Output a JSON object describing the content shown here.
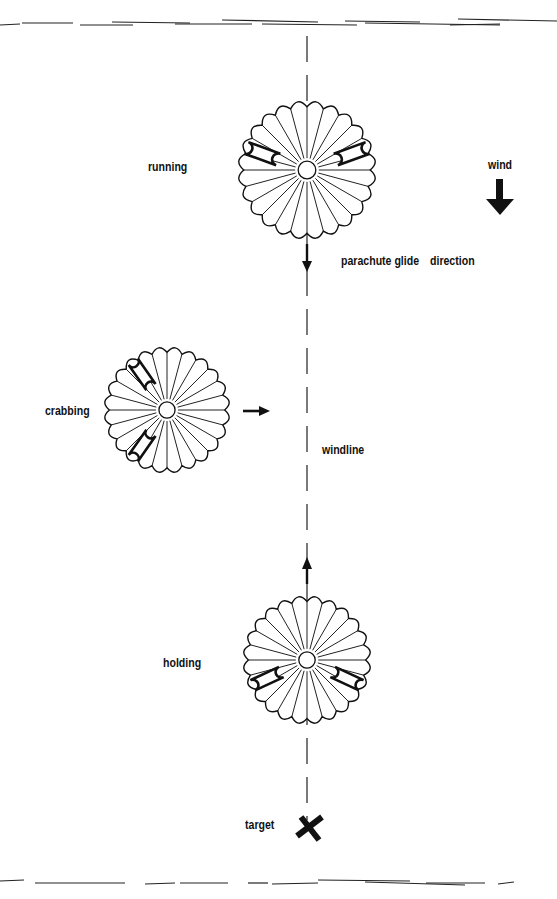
{
  "diagram": {
    "title": "",
    "labels": {
      "running": "running",
      "wind": "wind",
      "glide": "parachute glide",
      "direction": "direction",
      "crabbing": "crabbing",
      "windline": "windline",
      "holding": "holding",
      "target": "target"
    },
    "parachutes": [
      {
        "id": "running",
        "label": "running",
        "cx": 307,
        "cy": 170,
        "r": 68,
        "motion": "down"
      },
      {
        "id": "crabbing",
        "label": "crabbing",
        "cx": 167,
        "cy": 410,
        "r": 62,
        "motion": "right"
      },
      {
        "id": "holding",
        "label": "holding",
        "cx": 307,
        "cy": 660,
        "r": 63,
        "motion": "up"
      }
    ],
    "windline_x": 307,
    "wind_direction": "down",
    "target": {
      "x": 309,
      "y": 826,
      "glyph": "X"
    },
    "icons": [
      "wind-arrow-icon",
      "glide-arrow-icon",
      "target-x-icon"
    ],
    "colors": {
      "ink": "#111111",
      "paper": "#ffffff"
    }
  }
}
